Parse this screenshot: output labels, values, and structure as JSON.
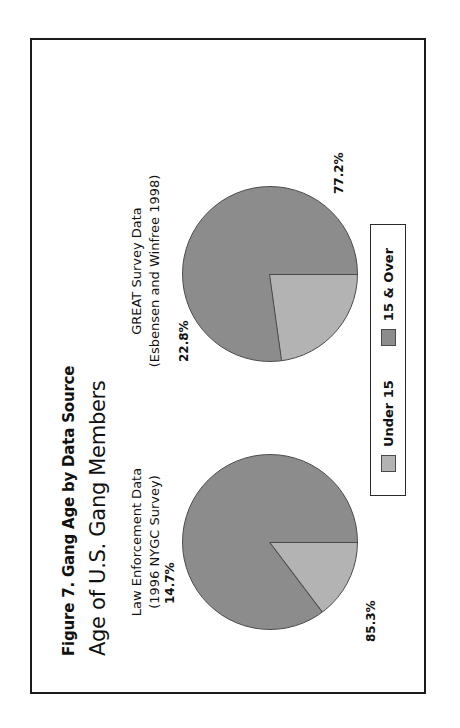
{
  "figure": {
    "title": "Figure 7. Gang Age by Data Source",
    "subtitle": "Age of U.S. Gang Members",
    "rotation_deg": -90,
    "frame_border_color": "#1a1a1a",
    "background": "#ffffff"
  },
  "legend": {
    "entries": [
      {
        "label": "Under 15",
        "color": "#b3b3b3"
      },
      {
        "label": "15 & Over",
        "color": "#8c8c8c"
      }
    ]
  },
  "panels": {
    "left": {
      "caption_line1": "Law Enforcement Data",
      "caption_line2": "(1996 NYGC Survey)",
      "labels": {
        "small": "14.7%",
        "large": "85.3%"
      }
    },
    "right": {
      "caption_line1": "GREAT Survey Data",
      "caption_line2": "(Esbensen and Winfree 1998)",
      "labels": {
        "small": "22.8%",
        "large": "77.2%"
      }
    }
  },
  "chart_data": [
    {
      "type": "pie",
      "title": "Law Enforcement Data (1996 NYGC Survey)",
      "categories": [
        "Under 15",
        "15 & Over"
      ],
      "values": [
        14.7,
        85.3
      ],
      "value_labels": [
        "14.7%",
        "85.3%"
      ],
      "colors": [
        "#b3b3b3",
        "#8c8c8c"
      ],
      "units": "percent",
      "legend": "bottom-center",
      "grid": false
    },
    {
      "type": "pie",
      "title": "GREAT Survey Data (Esbensen and Winfree 1998)",
      "categories": [
        "Under 15",
        "15 & Over"
      ],
      "values": [
        22.8,
        77.2
      ],
      "value_labels": [
        "22.8%",
        "77.2%"
      ],
      "colors": [
        "#b3b3b3",
        "#8c8c8c"
      ],
      "units": "percent",
      "legend": "bottom-center",
      "grid": false
    }
  ]
}
